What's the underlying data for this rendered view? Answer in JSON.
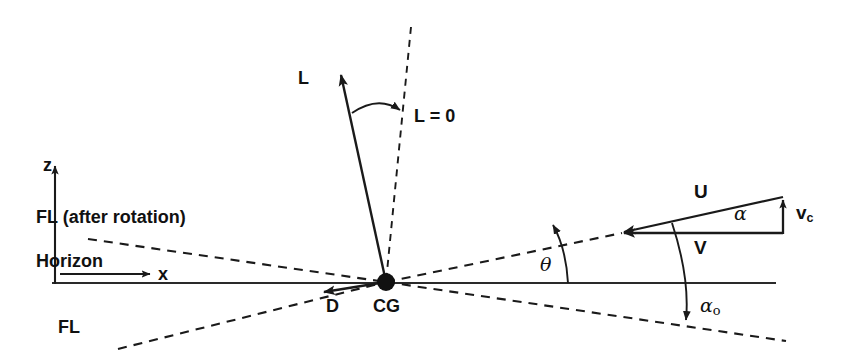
{
  "figure": {
    "type": "vector-force-diagram",
    "background_color": "#ffffff",
    "line_color": "#1a1a1a",
    "width": 848,
    "height": 363
  },
  "axes": {
    "vertical_label": "z",
    "horizontal_label": "x",
    "horizon_label": "Horizon"
  },
  "labels": {
    "lift": "L",
    "zero_lift_line": "L = 0",
    "drag": "D",
    "center_of_gravity": "CG",
    "fl_after_rotation": "FL (after rotation)",
    "fl": "FL",
    "resultant_velocity": "U",
    "forward_velocity": "V",
    "climb_velocity_base": "v",
    "climb_velocity_sub": "c",
    "alpha": "α",
    "alpha_o_base": "α",
    "alpha_o_sub": "o",
    "theta": "θ"
  },
  "geometry": {
    "cg_point": {
      "x": 386,
      "y": 282,
      "radius": 9
    },
    "lift_vector": {
      "x1": 386,
      "y1": 282,
      "x2": 340,
      "y2": 72
    },
    "drag_vector": {
      "x1": 386,
      "y1": 282,
      "x2": 320,
      "y2": 293
    },
    "zero_lift_dashed": {
      "x1": 411,
      "y1": 28,
      "x2": 386,
      "y2": 282
    },
    "horizon_line": {
      "x1": 52,
      "y1": 283,
      "x2": 776,
      "y2": 283
    },
    "z_axis": {
      "x1": 55,
      "y1": 283,
      "x2": 55,
      "y2": 163
    },
    "x_axis": {
      "x1": 62,
      "y1": 274,
      "x2": 150,
      "y2": 274
    },
    "fl_after_rotation_line": {
      "x1": 88,
      "y1": 239,
      "x2": 386,
      "y2": 282
    },
    "fl_after_rotation_right": {
      "x1": 386,
      "y1": 282,
      "x2": 620,
      "y2": 233
    },
    "fl_line_left": {
      "x1": 118,
      "y1": 348,
      "x2": 386,
      "y2": 282
    },
    "fl_line_right": {
      "x1": 386,
      "y1": 282,
      "x2": 784,
      "y2": 341
    },
    "velocity_triangle": {
      "apex": {
        "x": 783,
        "y": 197
      },
      "tip": {
        "x": 620,
        "y": 233
      },
      "base_right": {
        "x": 783,
        "y": 233
      }
    },
    "theta_arc": {
      "cx": 386,
      "cy": 282,
      "r": 182
    },
    "alpha_o_arc": {
      "cx": 386,
      "cy": 282,
      "r": 300
    },
    "lift_arc": {
      "cx": 386,
      "cy": 282,
      "r": 180
    }
  },
  "annotations": {
    "note_theta": "Angle between horizon and flight line after rotation",
    "note_alpha_o": "Angle between flight line and flight line after rotation",
    "note_alpha": "Angle of attack between U and V"
  }
}
